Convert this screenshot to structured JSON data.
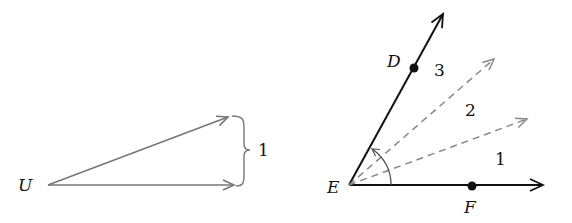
{
  "left_figure": {
    "point_label": "U",
    "brace_label": "1",
    "arrow_color": "#777777"
  },
  "right_figure": {
    "vertex_label": "E",
    "point_d_label": "D",
    "point_f_label": "F",
    "region_labels": [
      "1",
      "2",
      "3"
    ],
    "solid_color": "#111111",
    "dashed_color": "#888888"
  }
}
